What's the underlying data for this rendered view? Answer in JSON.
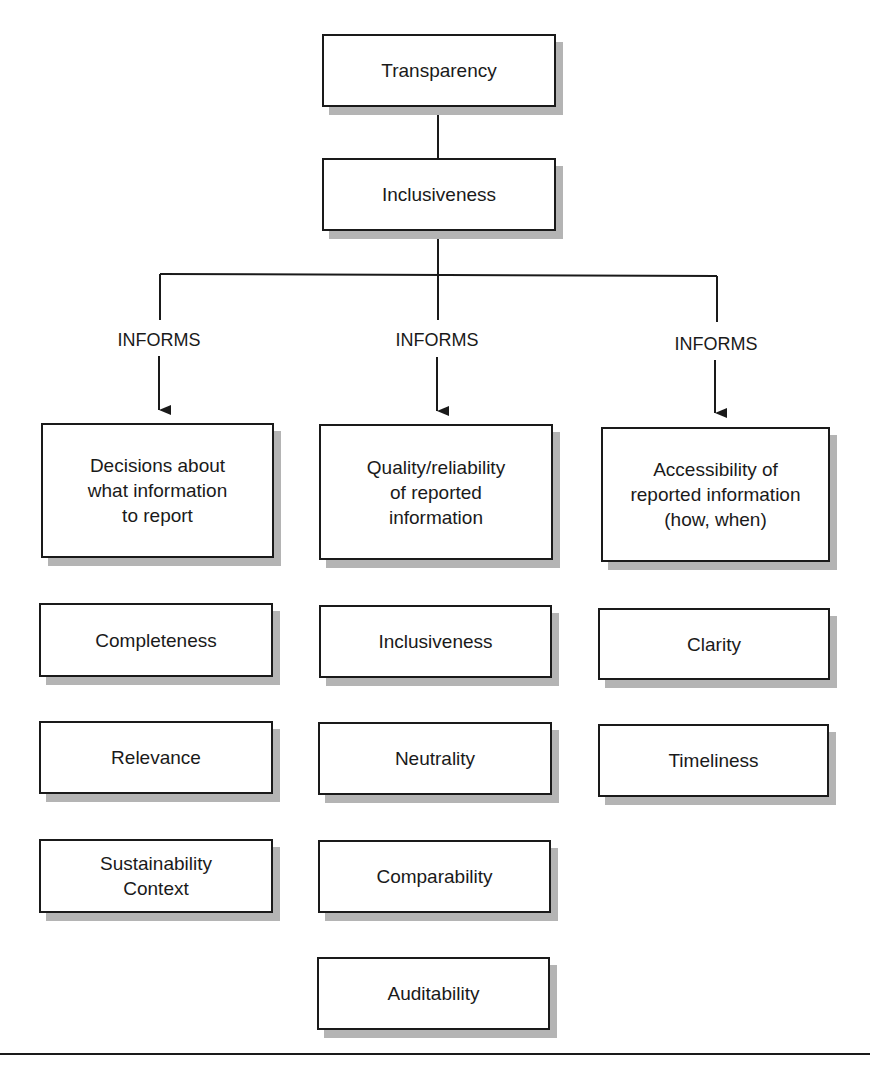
{
  "diagram": {
    "top": {
      "label": "Transparency"
    },
    "second": {
      "label": "Inclusiveness"
    },
    "connectors": [
      {
        "label": "INFORMS"
      },
      {
        "label": "INFORMS"
      },
      {
        "label": "INFORMS"
      }
    ],
    "columns": [
      {
        "header": "Decisions about\nwhat information\nto report",
        "items": [
          "Completeness",
          "Relevance",
          "Sustainability\nContext"
        ]
      },
      {
        "header": "Quality/reliability\nof reported\ninformation",
        "items": [
          "Inclusiveness",
          "Neutrality",
          "Comparability",
          "Auditability"
        ]
      },
      {
        "header": "Accessibility of\nreported information\n(how, when)",
        "items": [
          "Clarity",
          "Timeliness"
        ]
      }
    ]
  },
  "colors": {
    "line": "#1a1a1a",
    "shadow": "#b4b4b4",
    "background": "#ffffff"
  }
}
